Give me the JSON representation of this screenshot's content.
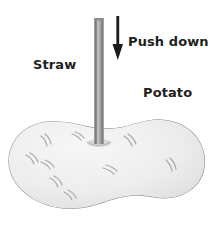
{
  "figure": {
    "background_color": "#ffffff",
    "labels": {
      "straw": "Straw",
      "push_down": "Push down",
      "potato": "Potato"
    },
    "colors": {
      "text": "#231f20",
      "arrow": "#1a1a1a",
      "straw_fill": "#9d9d9d",
      "straw_edge_dark": "#7b7b7b",
      "straw_edge_light": "#c4c4c4",
      "potato_fill": "#ededed",
      "potato_outline": "#8a8a8a",
      "potato_eye": "#a9a9a9"
    },
    "icons": {
      "arrow": "arrow-down-icon",
      "straw": "straw-cylinder-icon",
      "potato": "potato-blob-icon"
    }
  }
}
